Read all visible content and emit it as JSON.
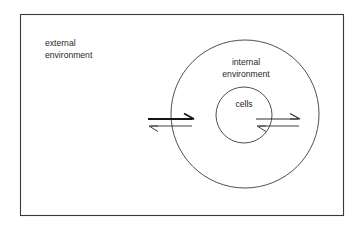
{
  "figure": {
    "background_color": "#ffffff",
    "frame": {
      "name": "figure-border",
      "stroke_color": "#3a3a3a",
      "x": 20,
      "y": 14,
      "width": 323,
      "height": 201
    }
  },
  "labels": {
    "external": {
      "line1": "external",
      "line2": "environment",
      "x": 45,
      "y1": 44,
      "y2": 56
    },
    "internal": {
      "line1": "internal",
      "line2": "environment",
      "x": 246,
      "y1": 63,
      "y2": 75
    },
    "cells": {
      "line1": "cells",
      "x": 244,
      "y1": 105
    }
  },
  "shapes": {
    "outer_circle": {
      "name": "internal-environment-circle",
      "cx": 245,
      "cy": 114,
      "r": 74,
      "stroke_color": "#3a3a3a"
    },
    "inner_circle": {
      "name": "cells-circle",
      "cx": 244,
      "cy": 115,
      "r": 28,
      "stroke_color": "#3a3a3a"
    }
  },
  "arrows": {
    "left_pair": {
      "name": "external-internal-exchange-arrows",
      "description": "bidirectional exchange across the outer circle boundary",
      "forward": {
        "direction": "right",
        "x_start": 148,
        "x_end": 194,
        "y": 119,
        "weight": "bold",
        "stroke_color": "#151515"
      },
      "reverse": {
        "direction": "left",
        "x_start": 192,
        "x_end": 149,
        "y": 126,
        "weight": "thin",
        "stroke_color": "#2e2e2e"
      }
    },
    "right_pair": {
      "name": "internal-cells-exchange-arrows",
      "description": "bidirectional exchange across the inner cells boundary",
      "forward": {
        "direction": "right",
        "x_start": 256,
        "x_end": 300,
        "y": 119,
        "weight": "normal",
        "stroke_color": "#2e2e2e"
      },
      "reverse": {
        "direction": "left",
        "x_start": 299,
        "x_end": 257,
        "y": 126,
        "weight": "thin",
        "stroke_color": "#2e2e2e"
      }
    }
  }
}
